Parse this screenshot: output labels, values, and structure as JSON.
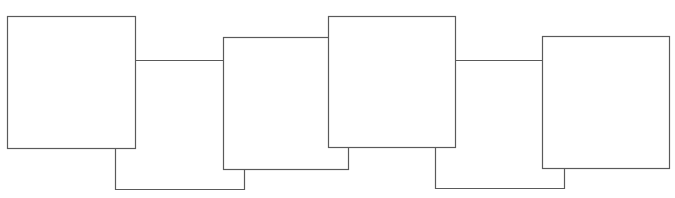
{
  "diagram": {
    "type": "connected-boxes",
    "stroke_color": "#5a5a5a",
    "fill_color": "#ffffff",
    "boxes": [
      {
        "id": "box-1",
        "x": 7,
        "y": 16,
        "w": 128,
        "h": 132
      },
      {
        "id": "box-2",
        "x": 223,
        "y": 37,
        "w": 125,
        "h": 132
      },
      {
        "id": "box-3",
        "x": 328,
        "y": 16,
        "w": 127,
        "h": 131
      },
      {
        "id": "box-4",
        "x": 542,
        "y": 36,
        "w": 127,
        "h": 132
      }
    ],
    "connectors": [
      {
        "id": "link-1-2-top",
        "points": [
          [
            135,
            60
          ],
          [
            223,
            60
          ]
        ]
      },
      {
        "id": "link-1-2-bottom",
        "points": [
          [
            115,
            148
          ],
          [
            115,
            189
          ],
          [
            244,
            189
          ],
          [
            244,
            169
          ]
        ]
      },
      {
        "id": "link-3-4-top",
        "points": [
          [
            455,
            60
          ],
          [
            542,
            60
          ]
        ]
      },
      {
        "id": "link-3-4-bottom",
        "points": [
          [
            435,
            147
          ],
          [
            435,
            188
          ],
          [
            564,
            188
          ],
          [
            564,
            168
          ]
        ]
      }
    ]
  }
}
